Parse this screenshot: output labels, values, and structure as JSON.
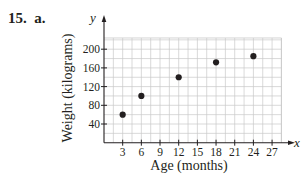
{
  "problem": {
    "number": "15.",
    "part": "a."
  },
  "chart_data": {
    "type": "scatter",
    "title": "",
    "xlabel": "Age (months)",
    "ylabel": "Weight (kilograms)",
    "x_axis_var": "x",
    "y_axis_var": "y",
    "x": [
      3,
      6,
      12,
      18,
      24
    ],
    "y": [
      60,
      100,
      140,
      172,
      185
    ],
    "series": [
      {
        "name": "Weight by age",
        "x": [
          3,
          6,
          12,
          18,
          24
        ],
        "y": [
          60,
          100,
          140,
          172,
          185
        ]
      }
    ],
    "xticks": [
      3,
      6,
      9,
      12,
      15,
      18,
      21,
      24,
      27
    ],
    "yticks": [
      40,
      80,
      120,
      160,
      200
    ],
    "xlim": [
      0,
      28.5
    ],
    "ylim": [
      0,
      224
    ],
    "grid": true,
    "grid_minor_x_step": 1.5,
    "grid_minor_y_step": 20,
    "legend": null,
    "colors": {
      "point": "#231f20",
      "grid": "#c8c8c8",
      "axis": "#231f20"
    }
  }
}
